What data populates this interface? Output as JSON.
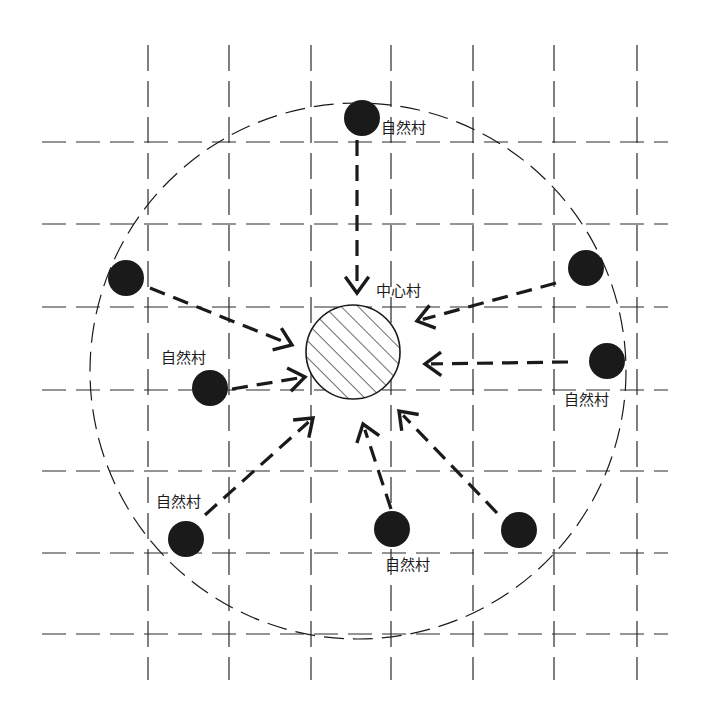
{
  "diagram": {
    "type": "central-village-radial-layout",
    "colors": {
      "background": "#ffffff",
      "ink": "#1a1a1a",
      "grid": "#2a2a2a"
    },
    "grid": {
      "vertical_x": [
        148,
        229,
        311,
        391,
        473,
        554,
        637
      ],
      "horizontal_y": [
        142,
        224,
        307,
        390,
        471,
        553,
        634
      ],
      "x_range": [
        42,
        668
      ],
      "y_range": [
        45,
        680
      ]
    },
    "service_radius_circle": {
      "cx": 358,
      "cy": 371,
      "r": 268
    },
    "central_village": {
      "label": "中心村",
      "cx": 353,
      "cy": 352,
      "r": 47,
      "label_x": 376,
      "label_y": 296
    },
    "natural_villages": [
      {
        "id": "nv-top",
        "cx": 362,
        "cy": 118,
        "r": 18,
        "label": "自然村",
        "label_x": 381,
        "label_y": 133
      },
      {
        "id": "nv-left",
        "cx": 126,
        "cy": 278,
        "r": 18,
        "label": ""
      },
      {
        "id": "nv-mid-left",
        "cx": 210,
        "cy": 388,
        "r": 18,
        "label": "自然村",
        "label_x": 161,
        "label_y": 363
      },
      {
        "id": "nv-bottom-left",
        "cx": 186,
        "cy": 539,
        "r": 18,
        "label": "自然村",
        "label_x": 156,
        "label_y": 507
      },
      {
        "id": "nv-bottom-center",
        "cx": 392,
        "cy": 529,
        "r": 18,
        "label": "自然村",
        "label_x": 385,
        "label_y": 570
      },
      {
        "id": "nv-bottom-right",
        "cx": 519,
        "cy": 530,
        "r": 18,
        "label": ""
      },
      {
        "id": "nv-right-upper",
        "cx": 586,
        "cy": 268,
        "r": 18,
        "label": ""
      },
      {
        "id": "nv-right-mid",
        "cx": 607,
        "cy": 361,
        "r": 18,
        "label": "自然村",
        "label_x": 564,
        "label_y": 405
      }
    ],
    "arrows": [
      {
        "from": "nv-top",
        "x1": 357,
        "y1": 140,
        "x2": 357,
        "y2": 293
      },
      {
        "from": "nv-left",
        "x1": 150,
        "y1": 288,
        "x2": 292,
        "y2": 345
      },
      {
        "from": "nv-mid-left",
        "x1": 232,
        "y1": 389,
        "x2": 305,
        "y2": 377
      },
      {
        "from": "nv-bottom-left",
        "x1": 205,
        "y1": 515,
        "x2": 313,
        "y2": 418
      },
      {
        "from": "nv-bottom-center",
        "x1": 391,
        "y1": 509,
        "x2": 363,
        "y2": 424
      },
      {
        "from": "nv-bottom-right",
        "x1": 497,
        "y1": 513,
        "x2": 399,
        "y2": 411
      },
      {
        "from": "nv-right-upper",
        "x1": 556,
        "y1": 283,
        "x2": 417,
        "y2": 321
      },
      {
        "from": "nv-right-mid",
        "x1": 568,
        "y1": 362,
        "x2": 425,
        "y2": 364
      }
    ],
    "icons": {
      "natural_village": "filled-black-circle",
      "central_village": "hatched-circle",
      "flow": "dashed-open-arrow"
    }
  }
}
